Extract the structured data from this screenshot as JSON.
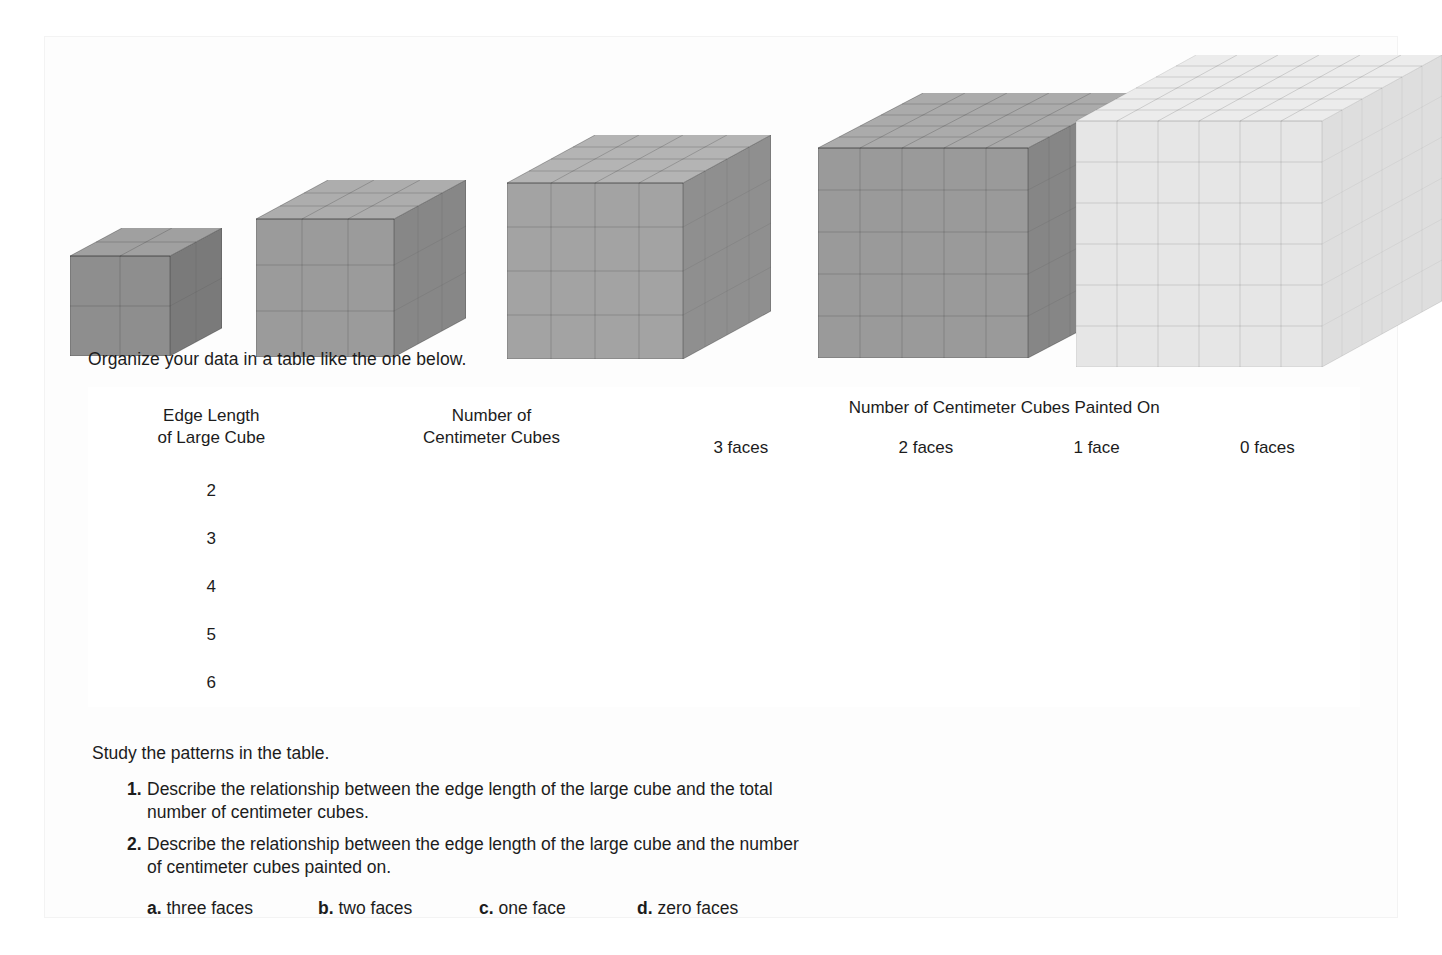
{
  "intro": {
    "text": "Organize your data in a table like the one below."
  },
  "cubes": {
    "caption_hidden": "",
    "items": [
      {
        "name": "cube-2",
        "edge": 2,
        "fill": "#8e8e8e",
        "top": "#a0a0a0",
        "side": "#7a7a7a"
      },
      {
        "name": "cube-3",
        "edge": 3,
        "fill": "#9b9b9b",
        "top": "#adadad",
        "side": "#878787"
      },
      {
        "name": "cube-4",
        "edge": 4,
        "fill": "#a3a3a3",
        "top": "#b4b4b4",
        "side": "#8f8f8f"
      },
      {
        "name": "cube-5",
        "edge": 5,
        "fill": "#9a9a9a",
        "top": "#ababab",
        "side": "#868686"
      },
      {
        "name": "cube-6",
        "edge": 6,
        "fill": "#e6e6e6",
        "top": "#ececec",
        "side": "#dedede"
      }
    ]
  },
  "table": {
    "col1_header_line1": "Edge Length",
    "col1_header_line2": "of Large Cube",
    "col2_header_line1": "Number of",
    "col2_header_line2": "Centimeter Cubes",
    "group_header": "Number of Centimeter Cubes Painted On",
    "face_headers": [
      "3 faces",
      "2 faces",
      "1 face",
      "0 faces"
    ],
    "rows": [
      {
        "edge": "2",
        "cells": [
          "",
          "",
          "",
          "",
          ""
        ]
      },
      {
        "edge": "3",
        "cells": [
          "",
          "",
          "",
          "",
          ""
        ]
      },
      {
        "edge": "4",
        "cells": [
          "",
          "",
          "",
          "",
          ""
        ]
      },
      {
        "edge": "5",
        "cells": [
          "",
          "",
          "",
          "",
          ""
        ]
      },
      {
        "edge": "6",
        "cells": [
          "",
          "",
          "",
          "",
          ""
        ]
      }
    ]
  },
  "footer": {
    "study_line": "Study the patterns in the table.",
    "questions": [
      {
        "num": "1.",
        "text": "Describe the relationship between the edge length of the large cube and the total number of centimeter cubes."
      },
      {
        "num": "2.",
        "text": "Describe the relationship between the edge length of the large cube and the number of centimeter cubes painted on."
      }
    ],
    "choices": [
      {
        "label": "a.",
        "text": " three faces"
      },
      {
        "label": "b.",
        "text": " two faces"
      },
      {
        "label": "c.",
        "text": " one face"
      },
      {
        "label": "d.",
        "text": " zero faces"
      }
    ]
  },
  "colors": {
    "page_background": "#ffffff",
    "panel_background": "#fdfdfd",
    "rule": "#8d8d8d",
    "text": "#1c1c1c"
  }
}
